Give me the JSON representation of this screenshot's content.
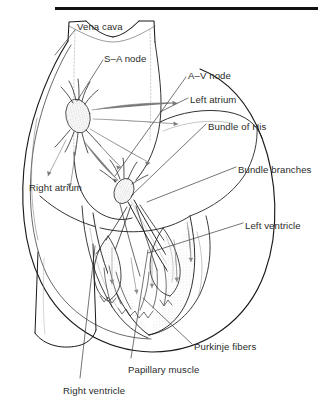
{
  "figure": {
    "background_color": "#ffffff",
    "ink_color": "#1a1a1a",
    "shade_color": "#e8e8e8",
    "text_color": "#2b2b2b",
    "rule": {
      "name": "top-horizontal-rule",
      "x": 55,
      "y": 7,
      "width": 263,
      "height": 3,
      "color": "#111111"
    }
  },
  "labels": [
    {
      "id": "vena-cava",
      "text": "Vena cava",
      "x": 77,
      "y": 21
    },
    {
      "id": "sa-node",
      "text": "S–A node",
      "x": 104,
      "y": 53
    },
    {
      "id": "av-node",
      "text": "A–V node",
      "x": 188,
      "y": 70
    },
    {
      "id": "left-atrium",
      "text": "Left atrium",
      "x": 190,
      "y": 94
    },
    {
      "id": "bundle-of-his",
      "text": "Bundle of His",
      "x": 208,
      "y": 121
    },
    {
      "id": "bundle-branches",
      "text": "Bundle branches",
      "x": 238,
      "y": 164
    },
    {
      "id": "left-ventricle",
      "text": "Left ventricle",
      "x": 245,
      "y": 220
    },
    {
      "id": "right-atrium",
      "text": "Right atrium",
      "x": 29,
      "y": 182
    },
    {
      "id": "purkinje-fibers",
      "text": "Purkinje fibers",
      "x": 194,
      "y": 341
    },
    {
      "id": "papillary-muscle",
      "text": "Papillary muscle",
      "x": 128,
      "y": 364
    },
    {
      "id": "right-ventricle",
      "text": "Right ventricle",
      "x": 63,
      "y": 385
    }
  ],
  "leader_lines": [
    {
      "id": "leader-vena-cava",
      "d": "M 75 30 L 55 55"
    },
    {
      "id": "leader-sa-node",
      "d": "M 103 60 L 77 101"
    },
    {
      "id": "leader-av-node",
      "d": "M 186 77 L 115 176"
    },
    {
      "id": "leader-left-atrium",
      "d": "M 188 98 L 160 112"
    },
    {
      "id": "leader-bundle-of-his",
      "d": "M 206 124 L 131 196"
    },
    {
      "id": "leader-bundle-branches",
      "d": "M 236 167 L 147 202"
    },
    {
      "id": "leader-left-ventricle",
      "d": "M 243 223 L 148 253"
    },
    {
      "id": "leader-purkinje",
      "d": "M 192 344 L 143 298"
    },
    {
      "id": "leader-papillary",
      "d": "M 131 358 L 148 250"
    },
    {
      "id": "leader-right-ventricle",
      "d": "M 80 378 L 95 246"
    }
  ]
}
